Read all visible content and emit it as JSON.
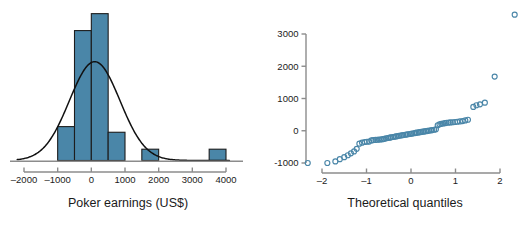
{
  "figure": {
    "width": 526,
    "height": 231,
    "background": "#ffffff",
    "panels": [
      "histogram",
      "normal-qq-plot"
    ]
  },
  "style": {
    "bar_fill": "#4a86a8",
    "bar_stroke": "#1d1d1d",
    "point_stroke": "#4a86a8",
    "axis_color": "#8c8c8c",
    "curve_color": "#111111",
    "text_color": "#1b1b1b"
  },
  "chart_data": [
    {
      "type": "bar",
      "name": "histogram",
      "title": "",
      "xlabel": "Poker earnings (US$)",
      "ylabel": "",
      "grid": false,
      "legend": null,
      "xlim": [
        -2000,
        4000
      ],
      "xticks": [
        -2000,
        -1000,
        0,
        1000,
        2000,
        3000,
        4000
      ],
      "xtick_labels": [
        "–2000",
        "–1000",
        "0",
        "1000",
        "2000",
        "3000",
        "4000"
      ],
      "bin_width": 500,
      "bin_edges": [
        -1000,
        -500,
        0,
        500,
        1000,
        1500,
        2000,
        3500,
        4000
      ],
      "bins": [
        {
          "left": -1000,
          "right": -500,
          "count": 6
        },
        {
          "left": -500,
          "right": 0,
          "count": 23
        },
        {
          "left": 0,
          "right": 500,
          "count": 26
        },
        {
          "left": 500,
          "right": 1000,
          "count": 5
        },
        {
          "left": 1500,
          "right": 2000,
          "count": 2
        },
        {
          "left": 3500,
          "right": 4000,
          "count": 2
        }
      ],
      "overlay_curve": {
        "name": "normal density",
        "mean": 100,
        "sd": 750,
        "peak_count": 17.5
      },
      "ylim": [
        0,
        27
      ]
    },
    {
      "type": "scatter",
      "name": "normal-qq-plot",
      "title": "",
      "xlabel": "Theoretical quantiles",
      "ylabel": "",
      "grid": false,
      "legend": null,
      "xlim": [
        -2.45,
        2.45
      ],
      "ylim": [
        -1150,
        3750
      ],
      "xticks": [
        -2,
        -1,
        0,
        1,
        2
      ],
      "xtick_labels": [
        "–2",
        "–1",
        "0",
        "1",
        "2"
      ],
      "yticks": [
        -1000,
        0,
        1000,
        2000,
        3000
      ],
      "ytick_labels": [
        "-1000",
        "0",
        "1000",
        "2000",
        "3000"
      ],
      "marker": "open-circle",
      "points": [
        [
          -2.32,
          -1000
        ],
        [
          -1.88,
          -1000
        ],
        [
          -1.7,
          -950
        ],
        [
          -1.6,
          -880
        ],
        [
          -1.5,
          -820
        ],
        [
          -1.42,
          -760
        ],
        [
          -1.35,
          -700
        ],
        [
          -1.28,
          -640
        ],
        [
          -1.22,
          -560
        ],
        [
          -1.16,
          -400
        ],
        [
          -1.1,
          -370
        ],
        [
          -1.04,
          -350
        ],
        [
          -0.99,
          -340
        ],
        [
          -0.94,
          -335
        ],
        [
          -0.89,
          -300
        ],
        [
          -0.85,
          -290
        ],
        [
          -0.8,
          -285
        ],
        [
          -0.76,
          -280
        ],
        [
          -0.72,
          -275
        ],
        [
          -0.68,
          -270
        ],
        [
          -0.64,
          -260
        ],
        [
          -0.6,
          -250
        ],
        [
          -0.56,
          -235
        ],
        [
          -0.52,
          -225
        ],
        [
          -0.48,
          -215
        ],
        [
          -0.45,
          -205
        ],
        [
          -0.41,
          -195
        ],
        [
          -0.37,
          -185
        ],
        [
          -0.34,
          -175
        ],
        [
          -0.3,
          -165
        ],
        [
          -0.27,
          -155
        ],
        [
          -0.23,
          -148
        ],
        [
          -0.2,
          -140
        ],
        [
          -0.17,
          -132
        ],
        [
          -0.13,
          -124
        ],
        [
          -0.1,
          -116
        ],
        [
          -0.07,
          -108
        ],
        [
          -0.03,
          -100
        ],
        [
          0.0,
          -92
        ],
        [
          0.03,
          -84
        ],
        [
          0.07,
          -76
        ],
        [
          0.1,
          -68
        ],
        [
          0.13,
          -60
        ],
        [
          0.17,
          -52
        ],
        [
          0.2,
          -44
        ],
        [
          0.23,
          -36
        ],
        [
          0.27,
          -28
        ],
        [
          0.3,
          -20
        ],
        [
          0.34,
          -12
        ],
        [
          0.37,
          -4
        ],
        [
          0.41,
          4
        ],
        [
          0.45,
          12
        ],
        [
          0.48,
          20
        ],
        [
          0.52,
          30
        ],
        [
          0.56,
          45
        ],
        [
          0.6,
          170
        ],
        [
          0.64,
          200
        ],
        [
          0.68,
          215
        ],
        [
          0.72,
          225
        ],
        [
          0.76,
          235
        ],
        [
          0.8,
          245
        ],
        [
          0.85,
          252
        ],
        [
          0.89,
          258
        ],
        [
          0.94,
          265
        ],
        [
          0.99,
          272
        ],
        [
          1.04,
          280
        ],
        [
          1.1,
          290
        ],
        [
          1.16,
          300
        ],
        [
          1.22,
          320
        ],
        [
          1.28,
          340
        ],
        [
          1.4,
          740
        ],
        [
          1.47,
          790
        ],
        [
          1.55,
          820
        ],
        [
          1.66,
          870
        ],
        [
          1.88,
          1680
        ],
        [
          2.33,
          3600
        ]
      ]
    }
  ],
  "labels": {
    "hist_x_title": "Poker earnings (US$)",
    "qq_x_title": "Theoretical quantiles"
  }
}
